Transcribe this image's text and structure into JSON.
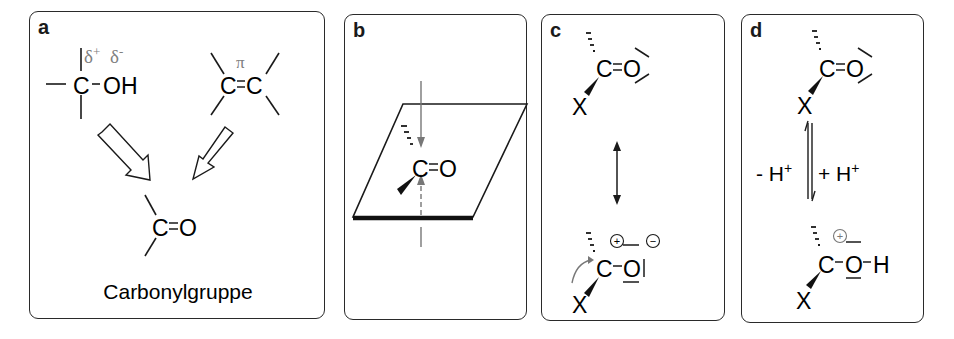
{
  "figure": {
    "panels": [
      {
        "id": "a",
        "letter": "a",
        "alcohol": {
          "carbon": "C",
          "group": "OH",
          "delta_plus": "δ",
          "plus_sign": "+",
          "delta_minus": "δ",
          "minus_sign": "-"
        },
        "alkene": {
          "left": "C",
          "bond": "=",
          "right": "C",
          "pi": "π"
        },
        "carbonyl": {
          "c": "C",
          "bond": "=",
          "o": "O"
        },
        "caption": "Carbonylgruppe"
      },
      {
        "id": "b",
        "letter": "b",
        "carbonyl": {
          "c": "C",
          "bond": "=",
          "o": "O"
        }
      },
      {
        "id": "c",
        "letter": "c",
        "top": {
          "c": "C",
          "bond": "=",
          "o": "O",
          "x": "X"
        },
        "bottom": {
          "c": "C",
          "bond": "–",
          "o": "O",
          "x": "X",
          "charge_c": "+",
          "charge_o": "−"
        }
      },
      {
        "id": "d",
        "letter": "d",
        "top": {
          "c": "C",
          "bond": "=",
          "o": "O",
          "x": "X"
        },
        "left_label": "- H",
        "left_sup": "+",
        "right_label": "+ H",
        "right_sup": "+",
        "bottom": {
          "c": "C",
          "bond1": "–",
          "o": "O",
          "bond2": "–",
          "h": "H",
          "x": "X",
          "charge": "+"
        }
      }
    ],
    "colors": {
      "ink": "#1a1a1a",
      "gray": "#777777",
      "border": "#2a2a2a"
    }
  }
}
